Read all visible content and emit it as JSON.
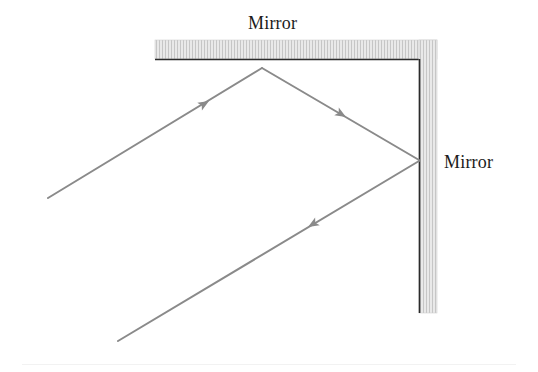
{
  "figure": {
    "background_color": "#ffffff",
    "labels": {
      "top_mirror": "Mirror",
      "right_mirror": "Mirror"
    },
    "colors": {
      "ray": "#8a8a8a",
      "arrowhead": "#8a8a8a",
      "mirror_fill": "#e9e9e9",
      "mirror_hatch": "#c6c6c6",
      "mirror_edge": "#2b2b2b",
      "label_text": "#1b1b1b",
      "bottom_rule": "#f2f2f2"
    },
    "mirrors": [
      {
        "name": "top-mirror",
        "orientation": "horizontal",
        "x": 155,
        "y": 40,
        "width": 282,
        "height": 19,
        "reflective_edge": "bottom"
      },
      {
        "name": "right-mirror",
        "orientation": "vertical",
        "x": 419,
        "y": 40,
        "width": 18,
        "height": 273,
        "reflective_edge": "left"
      }
    ],
    "ray_path": {
      "points": [
        {
          "name": "entry-point",
          "x": 48,
          "y": 198
        },
        {
          "name": "top-mirror-reflection",
          "x": 262,
          "y": 68
        },
        {
          "name": "right-mirror-reflection",
          "x": 419,
          "y": 160
        },
        {
          "name": "exit-point",
          "x": 118,
          "y": 341
        }
      ],
      "stroke_width": 2,
      "segments": [
        {
          "name": "incident-ray",
          "from": 0,
          "to": 1,
          "arrow_at": {
            "x": 205,
            "y": 103
          },
          "direction_deg": -31.1
        },
        {
          "name": "first-reflected-ray",
          "from": 1,
          "to": 2,
          "arrow_at": {
            "x": 342,
            "y": 115
          },
          "direction_deg": 30.4
        },
        {
          "name": "second-reflected-ray",
          "from": 2,
          "to": 3,
          "arrow_at": {
            "x": 312,
            "y": 224
          },
          "direction_deg": 149.1
        }
      ]
    }
  }
}
